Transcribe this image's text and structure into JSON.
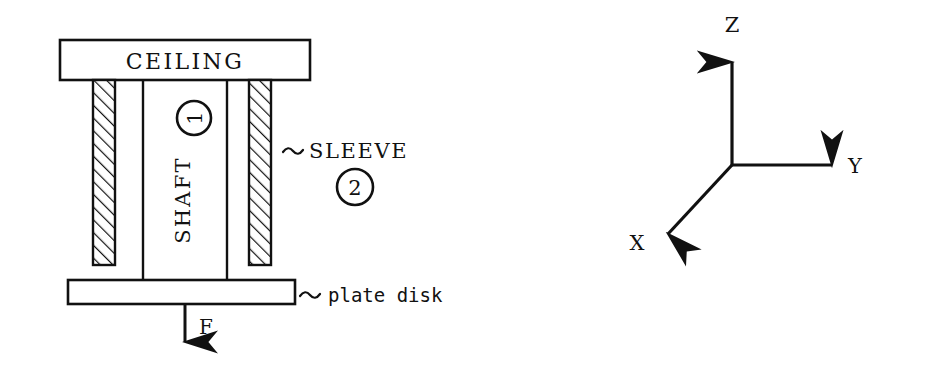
{
  "figure": {
    "background_color": "#ffffff",
    "line_color": "#111111"
  },
  "assembly": {
    "ceiling": {
      "label": "CEILING",
      "x": 60,
      "y": 40,
      "width": 250,
      "height": 40
    },
    "shaft": {
      "label": "SHAFT",
      "rotation_deg": -90,
      "x": 143,
      "y": 80,
      "width": 84,
      "height": 185
    },
    "left_sleeve": {
      "x": 93,
      "y": 80,
      "width": 22,
      "height": 185,
      "hatch": "diagonal"
    },
    "right_sleeve": {
      "x": 249,
      "y": 80,
      "width": 22,
      "height": 185,
      "hatch": "diagonal"
    },
    "plate": {
      "x": 68,
      "y": 280,
      "width": 227,
      "height": 24
    },
    "callout_sleeve": {
      "tilde": "∼",
      "label": "SLEEVE",
      "x": 285,
      "y": 152
    },
    "callout_plate": {
      "tilde": "∼",
      "label": "plate disk",
      "x": 300,
      "y": 297
    },
    "marker_one": {
      "label": "1",
      "cx": 194,
      "cy": 118,
      "r": 17,
      "rotation_deg": -90
    },
    "marker_two": {
      "label": "2",
      "cx": 355,
      "cy": 187,
      "r": 18,
      "rotation_deg": 0
    },
    "force": {
      "label": "F",
      "arrow_x": 185,
      "arrow_top": 304,
      "arrow_bottom": 352,
      "label_x": 199,
      "label_y": 332
    }
  },
  "axes": {
    "origin": {
      "x": 732,
      "y": 165
    },
    "z_axis": {
      "label": "Z",
      "tip_x": 732,
      "tip_y": 50,
      "label_x": 727,
      "label_y": 28
    },
    "y_axis": {
      "label": "Y",
      "tip_x": 840,
      "tip_y": 165,
      "label_x": 855,
      "label_y": 172
    },
    "x_axis": {
      "label": "X",
      "tip_x": 660,
      "tip_y": 240,
      "label_x": 636,
      "label_y": 247
    }
  }
}
